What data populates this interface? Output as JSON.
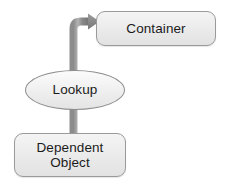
{
  "diagram": {
    "background_color": "#ffffff",
    "nodes": [
      {
        "id": "container",
        "label": "Container",
        "shape": "rounded-rectangle",
        "fill_color": "#ececec",
        "border_color": "#9a9a9a",
        "text_color": "#1b1b1b"
      },
      {
        "id": "lookup",
        "label": "Lookup",
        "shape": "ellipse",
        "fill_color": "#f0f0f0",
        "border_color": "#8f8f8f",
        "text_color": "#1b1b1b"
      },
      {
        "id": "dependent_object",
        "label": "Dependent\nObject",
        "shape": "rounded-rectangle",
        "fill_color": "#ececec",
        "border_color": "#9a9a9a",
        "text_color": "#1b1b1b"
      }
    ],
    "edges": [
      {
        "id": "dependent-to-container",
        "from": "dependent_object",
        "to": "container",
        "label": "",
        "style": "elbow-up-right",
        "arrowhead": "filled-triangle",
        "color": "#7d7d7d",
        "highlight_color": "#b0b0b0",
        "passes_through": "lookup"
      }
    ]
  }
}
